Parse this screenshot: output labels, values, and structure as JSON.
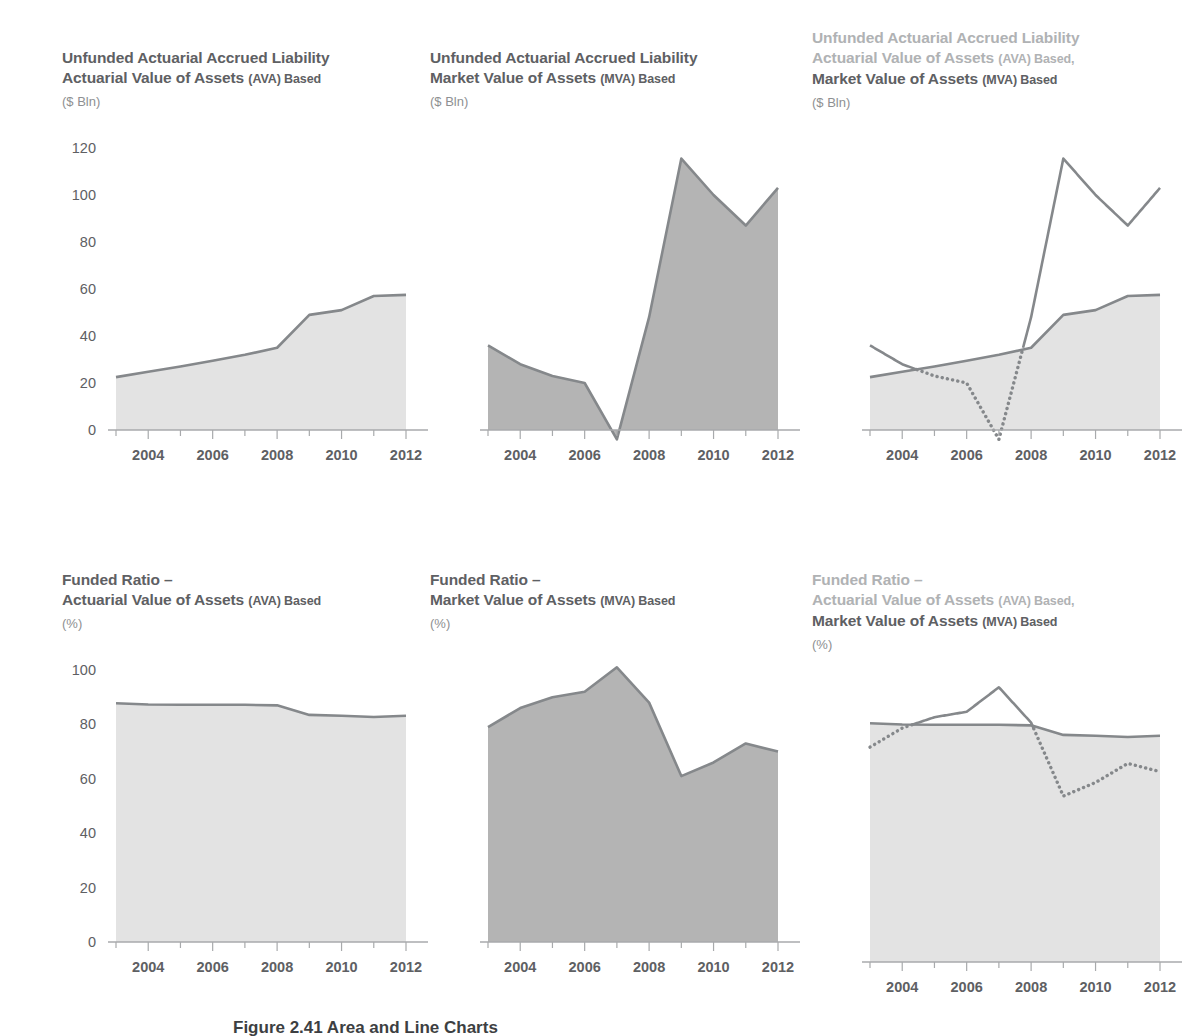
{
  "figure": {
    "caption": "Figure 2.41  Area and Line Charts"
  },
  "axis": {
    "x_categories": [
      "2003",
      "2004",
      "2005",
      "2006",
      "2007",
      "2008",
      "2009",
      "2010",
      "2011",
      "2012"
    ],
    "x_labels_shown": [
      "2004",
      "2006",
      "2008",
      "2010",
      "2012"
    ],
    "y_ticks_bln": [
      "0",
      "20",
      "40",
      "60",
      "80",
      "100",
      "120"
    ],
    "y_ticks_pct": [
      "0",
      "20",
      "40",
      "60",
      "80",
      "100"
    ]
  },
  "colors": {
    "fill_light": "#e3e3e3",
    "fill_dark": "#b4b4b4",
    "line": "#85888b",
    "text": "#5e6063",
    "text_muted": "#b0b2b4",
    "axis": "#a8aaac"
  },
  "panels": [
    {
      "id": "p0",
      "title_lines": [
        {
          "text": "Unfunded Actuarial Accrued Liability",
          "muted": false,
          "small_suffix": ""
        },
        {
          "text": "Actuarial Value of Assets ",
          "muted": false,
          "small_suffix": "(AVA) Based"
        }
      ],
      "unit": "($ Bln)",
      "show_y_axis": true,
      "chart_data": {
        "type": "area",
        "title": "Unfunded Actuarial Accrued Liability — Actuarial Value of Assets (AVA) Based",
        "xlabel": "",
        "ylabel": "$ Bln",
        "ylim": [
          0,
          120
        ],
        "grid": false,
        "categories": [
          "2003",
          "2004",
          "2005",
          "2006",
          "2007",
          "2008",
          "2009",
          "2010",
          "2011",
          "2012"
        ],
        "series": [
          {
            "name": "AVA",
            "style": "area-light",
            "values": [
              22.5,
              24.8,
              27.0,
              29.5,
              32.0,
              35.0,
              49.0,
              51.0,
              57.0,
              57.5
            ]
          }
        ]
      }
    },
    {
      "id": "p1",
      "title_lines": [
        {
          "text": "Unfunded Actuarial Accrued Liability",
          "muted": false,
          "small_suffix": ""
        },
        {
          "text": "Market Value of Assets ",
          "muted": false,
          "small_suffix": "(MVA) Based"
        }
      ],
      "unit": "($ Bln)",
      "show_y_axis": false,
      "chart_data": {
        "type": "area",
        "title": "Unfunded Actuarial Accrued Liability — Market Value of Assets (MVA) Based",
        "xlabel": "",
        "ylabel": "$ Bln",
        "ylim": [
          0,
          120
        ],
        "grid": false,
        "categories": [
          "2003",
          "2004",
          "2005",
          "2006",
          "2007",
          "2008",
          "2009",
          "2010",
          "2011",
          "2012"
        ],
        "series": [
          {
            "name": "MVA",
            "style": "area-dark",
            "values": [
              36.0,
              28.0,
              23.0,
              20.0,
              -4.0,
              48.0,
              115.5,
              100.0,
              87.0,
              103.0
            ]
          }
        ]
      }
    },
    {
      "id": "p2",
      "title_lines": [
        {
          "text": "Unfunded Actuarial Accrued Liability",
          "muted": true,
          "small_suffix": ""
        },
        {
          "text": "Actuarial Value of Assets ",
          "muted": true,
          "small_suffix": "(AVA) Based,"
        },
        {
          "text": "Market Value of Assets ",
          "muted": false,
          "small_suffix": "(MVA) Based"
        }
      ],
      "unit": "($ Bln)",
      "show_y_axis": false,
      "chart_data": {
        "type": "area",
        "title": "Unfunded Actuarial Accrued Liability — AVA Based, MVA Based",
        "xlabel": "",
        "ylabel": "$ Bln",
        "ylim": [
          0,
          120
        ],
        "grid": false,
        "categories": [
          "2003",
          "2004",
          "2005",
          "2006",
          "2007",
          "2008",
          "2009",
          "2010",
          "2011",
          "2012"
        ],
        "series": [
          {
            "name": "AVA",
            "style": "area-light",
            "values": [
              22.5,
              24.8,
              27.0,
              29.5,
              32.0,
              35.0,
              49.0,
              51.0,
              57.0,
              57.5
            ]
          },
          {
            "name": "MVA",
            "style": "line-split",
            "values": [
              36.0,
              28.0,
              23.0,
              20.0,
              -4.0,
              48.0,
              115.5,
              100.0,
              87.0,
              103.0
            ]
          }
        ]
      }
    },
    {
      "id": "p3",
      "title_lines": [
        {
          "text": "Funded Ratio –",
          "muted": false,
          "small_suffix": ""
        },
        {
          "text": "Actuarial Value of Assets ",
          "muted": false,
          "small_suffix": "(AVA) Based"
        }
      ],
      "unit": "(%)",
      "show_y_axis": true,
      "chart_data": {
        "type": "area",
        "title": "Funded Ratio – Actuarial Value of Assets (AVA) Based",
        "xlabel": "",
        "ylabel": "%",
        "ylim": [
          0,
          100
        ],
        "grid": false,
        "categories": [
          "2003",
          "2004",
          "2005",
          "2006",
          "2007",
          "2008",
          "2009",
          "2010",
          "2011",
          "2012"
        ],
        "series": [
          {
            "name": "AVA",
            "style": "area-light",
            "values": [
              87.8,
              87.3,
              87.2,
              87.2,
              87.2,
              87.0,
              83.5,
              83.2,
              82.7,
              83.2
            ]
          }
        ]
      }
    },
    {
      "id": "p4",
      "title_lines": [
        {
          "text": "Funded Ratio –",
          "muted": false,
          "small_suffix": ""
        },
        {
          "text": "Market Value of Assets ",
          "muted": false,
          "small_suffix": "(MVA) Based"
        }
      ],
      "unit": "(%)",
      "show_y_axis": false,
      "chart_data": {
        "type": "area",
        "title": "Funded Ratio – Market Value of Assets (MVA) Based",
        "xlabel": "",
        "ylabel": "%",
        "ylim": [
          0,
          100
        ],
        "grid": false,
        "categories": [
          "2003",
          "2004",
          "2005",
          "2006",
          "2007",
          "2008",
          "2009",
          "2010",
          "2011",
          "2012"
        ],
        "series": [
          {
            "name": "MVA",
            "style": "area-dark",
            "values": [
              79.0,
              86.0,
              90.0,
              92.0,
              101.0,
              88.0,
              61.0,
              66.0,
              73.0,
              70.0
            ]
          }
        ]
      }
    },
    {
      "id": "p5",
      "title_lines": [
        {
          "text": "Funded Ratio –",
          "muted": true,
          "small_suffix": ""
        },
        {
          "text": "Actuarial Value of Assets ",
          "muted": true,
          "small_suffix": "(AVA) Based,"
        },
        {
          "text": "Market Value of Assets ",
          "muted": false,
          "small_suffix": "(MVA) Based"
        }
      ],
      "unit": "(%)",
      "show_y_axis": false,
      "chart_data": {
        "type": "area",
        "title": "Funded Ratio – AVA Based, MVA Based",
        "xlabel": "",
        "ylabel": "%",
        "ylim": [
          0,
          100
        ],
        "grid": false,
        "categories": [
          "2003",
          "2004",
          "2005",
          "2006",
          "2007",
          "2008",
          "2009",
          "2010",
          "2011",
          "2012"
        ],
        "series": [
          {
            "name": "AVA",
            "style": "area-light",
            "values": [
              87.8,
              87.3,
              87.2,
              87.2,
              87.2,
              87.0,
              83.5,
              83.2,
              82.7,
              83.2
            ]
          },
          {
            "name": "MVA",
            "style": "line-split",
            "values": [
              79.0,
              86.0,
              90.0,
              92.0,
              101.0,
              88.0,
              61.0,
              66.0,
              73.0,
              70.0
            ]
          }
        ]
      }
    }
  ]
}
